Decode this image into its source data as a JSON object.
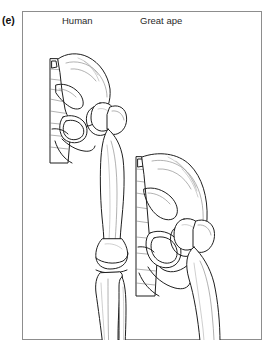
{
  "figure": {
    "panel_label": "(e)",
    "border_color": "#8d8d8d",
    "background_color": "#ffffff",
    "ink_color": "#1c1c1c",
    "shading_color": "#9a9a9a",
    "box": {
      "x": 22,
      "y": 11,
      "width": 240,
      "height": 329
    }
  },
  "specimens": [
    {
      "id": "human",
      "label": "Human",
      "label_x": 62,
      "label_y": 15,
      "description": "Human lower limb and pelvis in anterior view: short broad bowl-shaped pelvis, vertically oriented femur, knee directly beneath hip, straight parallel tibia and fibula, compact arched foot with short adducted toes.",
      "parts": [
        "sacrum",
        "ilium",
        "ischium",
        "pubis",
        "acetabulum",
        "femoral-head",
        "greater-trochanter",
        "femur",
        "femoral-condyles",
        "tibia",
        "fibula",
        "tarsals",
        "metatarsals",
        "phalanges"
      ]
    },
    {
      "id": "great-ape",
      "label": "Great ape",
      "label_x": 140,
      "label_y": 15,
      "description": "Great ape lower limb and pelvis: tall narrow elongated blade-like ilium, laterally flaring femur angled away from the midline, bowed tibia and fibula widely separated, long grasping foot with divergent opposable big toe and long curved toes.",
      "parts": [
        "sacrum",
        "ilium",
        "ischium",
        "pubis",
        "acetabulum",
        "femoral-head",
        "greater-trochanter",
        "femur",
        "femoral-condyles",
        "tibia",
        "fibula",
        "tarsals",
        "metatarsals",
        "phalanges",
        "hallux"
      ]
    }
  ]
}
